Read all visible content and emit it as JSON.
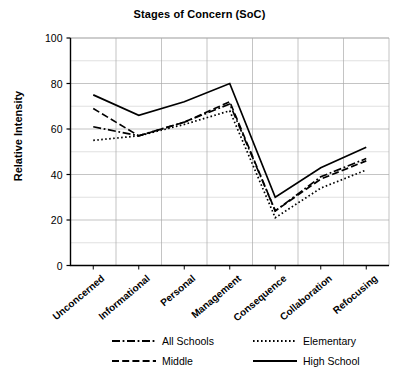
{
  "chart_data": {
    "type": "line",
    "title": "Stages of Concern (SoC)",
    "xlabel": "",
    "ylabel": "Relative Intensity",
    "categories": [
      "Unconcerned",
      "Informational",
      "Personal",
      "Management",
      "Consequence",
      "Collaboration",
      "Refocusing"
    ],
    "ylim": [
      0,
      100
    ],
    "yticks": [
      0,
      20,
      40,
      60,
      80,
      100
    ],
    "ytick_labels": [
      "0",
      "20",
      "40",
      "60",
      "80",
      "100"
    ],
    "grid": true,
    "legend_position": "bottom",
    "series": [
      {
        "name": "All Schools",
        "style": "dash-dot",
        "values": [
          61,
          57,
          63,
          71,
          24,
          39,
          47
        ]
      },
      {
        "name": "Elementary",
        "style": "dotted",
        "values": [
          55,
          57,
          62,
          68,
          21,
          34,
          42
        ]
      },
      {
        "name": "Middle",
        "style": "dashed",
        "values": [
          69,
          57,
          63,
          72,
          24,
          38,
          46
        ]
      },
      {
        "name": "High School",
        "style": "solid",
        "values": [
          75,
          66,
          72,
          80,
          30,
          43,
          52
        ]
      }
    ]
  },
  "axis": {
    "y_title": "Relative Intensity"
  },
  "legend": {
    "items": [
      {
        "label": "All Schools"
      },
      {
        "label": "Elementary"
      },
      {
        "label": "Middle"
      },
      {
        "label": "High School"
      }
    ]
  }
}
